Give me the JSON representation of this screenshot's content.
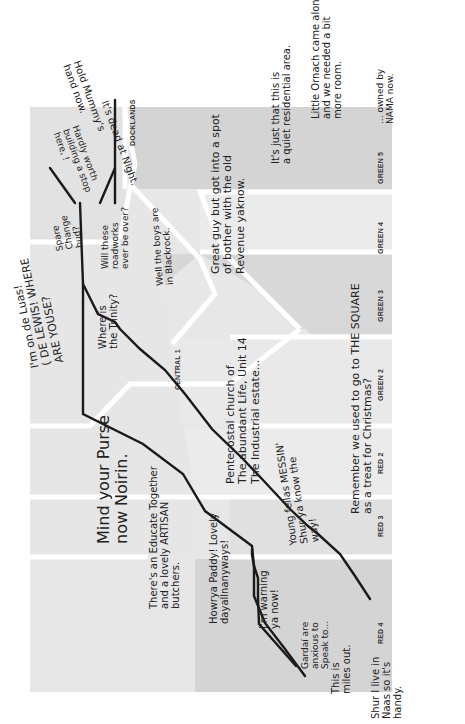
{
  "map": {
    "orientation": "rotated 90deg counter-clockwise",
    "colors": {
      "background": "#ffffff",
      "zone_light": "#e6e6e6",
      "zone_lighter": "#ebebeb",
      "zone_mid": "#d6d6d6",
      "zone_dark": "#cfcfcf",
      "divider": "#ffffff",
      "line": "#1a1a1a",
      "stop": "#1a1a1a",
      "interchange_fill": "#ffffff"
    },
    "zones": [
      {
        "id": "docklands",
        "label": "DOCKLANDS"
      },
      {
        "id": "central1",
        "label": "CENTRAL 1"
      },
      {
        "id": "red2",
        "label": "RED 2"
      },
      {
        "id": "red3",
        "label": "RED 3"
      },
      {
        "id": "red4",
        "label": "RED 4"
      },
      {
        "id": "green2",
        "label": "GREEN 2"
      },
      {
        "id": "green3",
        "label": "GREEN 3"
      },
      {
        "id": "green4",
        "label": "GREEN 4"
      },
      {
        "id": "green5",
        "label": "GREEN 5"
      }
    ],
    "annotations": {
      "hold_mummy": "Hold Mummy's\nhand now.",
      "dead_at_night": "It's dead at Night.",
      "hardly_worth": "Hardly worth\nbuilding a stop\nhere, !",
      "spare_change": "Spare\nChange\nbud?",
      "roadworks": "Will these\nroadworks\never be over?",
      "on_de_luas": "I'm on de Luas!\n( DE LEWIS! WHERE\nARE YOUSE?",
      "trinity": "Where is\nthe Trinity?",
      "mind_purse": "Mind your Purse\nnow Noirin.",
      "educate_together": "There's an Educate Together\nand a lovely ARTISAN\nbutchers.",
      "howrya_paddy": "Howrya Paddy! Lovely\ndayallnanyways!",
      "pentecostal": "Pentecostal church of\nThe abundant Life, Unit 14\nThe Industrial estate...",
      "young_fellas": "Young fellas MESSIN'\nShur ya know the\nway!",
      "im_warning": "I'm warning\nya now!",
      "remember_square": "Remember we used to go to THE SQUARE\nas a treat for Christmas?",
      "gardai": "Gardaí are\nanxious to\nSpeak to...",
      "miles_out": "This is\nmiles out.",
      "naas": "Shur I live in\nNaas so it's\nhandy.",
      "blackrock": "Well the boys are\nin Blackrock.",
      "great_guy": "Great guy but got into a spot\nof bother with the old\nRevenue yaknow.",
      "quiet_residential": "It's just that this is\na quiet residential area.",
      "little_ornach": "Little Ornach came along\nand we needed a bit\nmore room.",
      "owned_by_nama": "... owned by\nNAMA now."
    }
  }
}
